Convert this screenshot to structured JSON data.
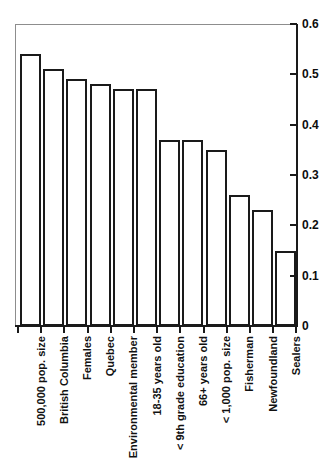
{
  "chart_data": {
    "type": "bar",
    "title": "",
    "subtitle": "",
    "xlabel": "",
    "ylabel": "",
    "ylim": [
      0,
      0.6
    ],
    "yticks": [
      "0",
      "0.1",
      "0.2",
      "0.3",
      "0.4",
      "0.5",
      "0.6"
    ],
    "ytick_values": [
      0,
      0.1,
      0.2,
      0.3,
      0.4,
      0.5,
      0.6
    ],
    "grid": false,
    "legend": null,
    "orientation": "vertical",
    "categories": [
      "500,000 pop. size",
      "British Columbia",
      "Females",
      "Quebec",
      "Environmental member",
      "18-35 years old",
      "< 9th grade education",
      "66+ years old",
      "< 1,000 pop. size",
      "Fisherman",
      "Newfoundland",
      "Sealers"
    ],
    "values": [
      0.54,
      0.51,
      0.49,
      0.48,
      0.47,
      0.47,
      0.37,
      0.37,
      0.35,
      0.26,
      0.23,
      0.15
    ],
    "bar_style": {
      "fill": "#ffffff",
      "edge": "#1a1a1a",
      "edge_width": 2
    }
  },
  "axes": {
    "y_axis_position": "right",
    "x_axis_position": "bottom",
    "frame_color": "#8d8d8d",
    "axis_color": "#1a1a1a"
  }
}
